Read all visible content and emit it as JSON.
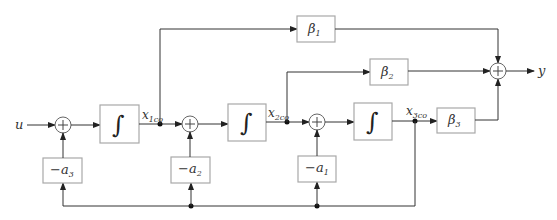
{
  "diagram": {
    "input_label": "u",
    "output_label": "y",
    "integrators": [
      {
        "symbol": "∫",
        "state": "x",
        "state_sub": "1co"
      },
      {
        "symbol": "∫",
        "state": "x",
        "state_sub": "2co"
      },
      {
        "symbol": "∫",
        "state": "x",
        "state_sub": "3co"
      }
    ],
    "feedback_gains": [
      {
        "prefix": "−a",
        "sub": "3"
      },
      {
        "prefix": "−a",
        "sub": "2"
      },
      {
        "prefix": "−a",
        "sub": "1"
      }
    ],
    "output_gains": [
      {
        "prefix": "β",
        "sub": "1"
      },
      {
        "prefix": "β",
        "sub": "2"
      },
      {
        "prefix": "β",
        "sub": "3"
      }
    ],
    "summing_symbol": "+",
    "colors": {
      "block_border": "#a8a8a8",
      "wire": "#333333",
      "node": "#111111"
    }
  }
}
